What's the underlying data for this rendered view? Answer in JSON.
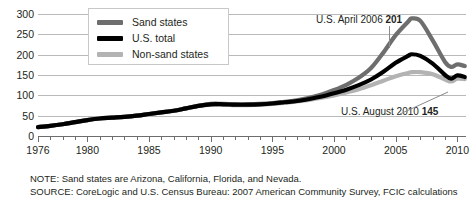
{
  "chart_data": {
    "type": "line",
    "title": "",
    "subtitle": "",
    "xlabel": "",
    "ylabel": "",
    "xlim": [
      1976,
      2010.7
    ],
    "ylim": [
      0,
      300
    ],
    "grid": true,
    "grid_axis": "y",
    "legend_position": "top-left-inside",
    "y_ticks": [
      300,
      250,
      200,
      150,
      100,
      50,
      0
    ],
    "x_ticks": [
      1976,
      1977,
      1978,
      1979,
      1980,
      1981,
      1982,
      1983,
      1984,
      1985,
      1986,
      1987,
      1988,
      1989,
      1990,
      1991,
      1992,
      1993,
      1994,
      1995,
      1996,
      1997,
      1998,
      1999,
      2000,
      2001,
      2002,
      2003,
      2004,
      2005,
      2006,
      2007,
      2008,
      2009,
      2010
    ],
    "x_tick_labels": [
      {
        "value": 1976,
        "label": "1976"
      },
      {
        "value": 1980,
        "label": "1980"
      },
      {
        "value": 1985,
        "label": "1985"
      },
      {
        "value": 1990,
        "label": "1990"
      },
      {
        "value": 1995,
        "label": "1995"
      },
      {
        "value": 2000,
        "label": "2000"
      },
      {
        "value": 2005,
        "label": "2005"
      },
      {
        "value": 2010,
        "label": "2010"
      }
    ],
    "x": [
      1976,
      1977,
      1978,
      1979,
      1980,
      1981,
      1982,
      1983,
      1984,
      1985,
      1986,
      1987,
      1988,
      1989,
      1990,
      1991,
      1992,
      1993,
      1994,
      1995,
      1996,
      1997,
      1998,
      1999,
      2000,
      2001,
      2002,
      2003,
      2004,
      2005,
      2006,
      2006.3,
      2007,
      2008,
      2009,
      2009.5,
      2010,
      2010.6
    ],
    "series": [
      {
        "name": "Sand states",
        "color": "#6e6e6e",
        "width": 4.2,
        "values": [
          22,
          25,
          29,
          34,
          39,
          43,
          45,
          47,
          50,
          54,
          58,
          62,
          68,
          74,
          79,
          79,
          78,
          78,
          79,
          81,
          84,
          88,
          94,
          102,
          113,
          126,
          143,
          167,
          205,
          248,
          281,
          289,
          283,
          235,
          182,
          170,
          176,
          172
        ]
      },
      {
        "name": "U.S. total",
        "color": "#000000",
        "width": 4.2,
        "values": [
          22,
          25,
          29,
          34,
          39,
          43,
          45,
          47,
          50,
          54,
          58,
          62,
          68,
          74,
          78,
          78,
          77,
          77,
          78,
          80,
          83,
          86,
          91,
          97,
          105,
          114,
          125,
          139,
          158,
          180,
          197,
          201,
          197,
          178,
          150,
          141,
          149,
          145
        ]
      },
      {
        "name": "Non-sand states",
        "color": "#b3b3b3",
        "width": 4.2,
        "values": [
          22,
          25,
          29,
          34,
          39,
          43,
          45,
          47,
          50,
          54,
          58,
          62,
          68,
          74,
          77,
          77,
          76,
          76,
          77,
          79,
          82,
          85,
          89,
          94,
          100,
          107,
          115,
          125,
          136,
          147,
          155,
          157,
          157,
          152,
          139,
          134,
          141,
          140
        ]
      }
    ],
    "annotations": [
      {
        "id": "peak",
        "prefix": "U.S. April 2006 ",
        "value": "201",
        "points_to": {
          "x": 2006.3,
          "y": 201
        }
      },
      {
        "id": "last",
        "prefix": "U.S. August 2010 ",
        "value": "145",
        "points_to": {
          "x": 2010.6,
          "y": 145
        }
      }
    ]
  },
  "legend": {
    "items": [
      {
        "label": "Sand states",
        "color": "#6e6e6e"
      },
      {
        "label": "U.S. total",
        "color": "#000000"
      },
      {
        "label": "Non-sand states",
        "color": "#b3b3b3"
      }
    ]
  },
  "footnotes": [
    {
      "text": "NOTE: Sand states are Arizona, California, Florida, and Nevada."
    },
    {
      "text": "SOURCE: CoreLogic and U.S. Census Bureau: 2007 American Community Survey, FCIC calculations"
    }
  ]
}
